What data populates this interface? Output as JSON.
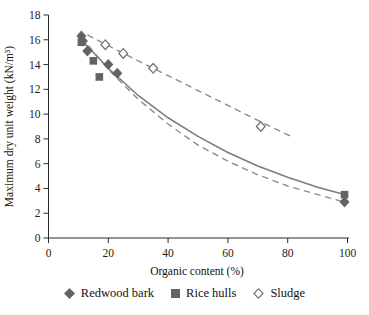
{
  "figure": {
    "background": "#ffffff"
  },
  "colors": {
    "axis": "#2b2b2b",
    "marker_fill": "#636363",
    "open_marker_stroke": "#757575",
    "solid_line": "#7d7d7d",
    "dashed_line": "#8c8c8c",
    "text": "#1c1c1c"
  },
  "chart_data": {
    "type": "scatter",
    "title": "",
    "xlabel": "Organic content (%)",
    "ylabel": "Maximum dry unit weight (kN/m³)",
    "xlim": [
      0,
      100
    ],
    "ylim": [
      0,
      18
    ],
    "xticks": [
      0,
      20,
      40,
      60,
      80,
      100
    ],
    "yticks": [
      0,
      2,
      4,
      6,
      8,
      10,
      12,
      14,
      16,
      18
    ],
    "grid": false,
    "legend_position": "bottom",
    "series": [
      {
        "name": "Redwood bark",
        "marker": "diamond-filled",
        "points": [
          [
            11,
            16.3
          ],
          [
            11.5,
            15.9
          ],
          [
            13,
            15.1
          ],
          [
            20,
            14.0
          ],
          [
            23,
            13.3
          ],
          [
            99,
            2.9
          ]
        ],
        "trendline": {
          "style": "dashed",
          "points": [
            [
              11,
              16.2
            ],
            [
              20,
              13.6
            ],
            [
              30,
              11.2
            ],
            [
              40,
              9.2
            ],
            [
              50,
              7.5
            ],
            [
              60,
              6.2
            ],
            [
              70,
              5.1
            ],
            [
              80,
              4.2
            ],
            [
              90,
              3.5
            ],
            [
              99,
              2.9
            ]
          ]
        }
      },
      {
        "name": "Rice hulls",
        "marker": "square-filled",
        "points": [
          [
            11,
            15.8
          ],
          [
            15,
            14.3
          ],
          [
            17,
            13.0
          ],
          [
            99,
            3.5
          ]
        ],
        "trendline": {
          "style": "solid",
          "points": [
            [
              11,
              16.0
            ],
            [
              20,
              13.7
            ],
            [
              30,
              11.5
            ],
            [
              40,
              9.7
            ],
            [
              50,
              8.2
            ],
            [
              60,
              6.9
            ],
            [
              70,
              5.8
            ],
            [
              80,
              4.9
            ],
            [
              90,
              4.1
            ],
            [
              99,
              3.5
            ]
          ]
        }
      },
      {
        "name": "Sludge",
        "marker": "diamond-open",
        "points": [
          [
            19,
            15.6
          ],
          [
            25,
            14.9
          ],
          [
            35,
            13.7
          ],
          [
            71,
            9.0
          ]
        ],
        "trendline": {
          "style": "dashed",
          "points": [
            [
              13,
              16.4
            ],
            [
              25,
              14.9
            ],
            [
              35,
              13.7
            ],
            [
              45,
              12.5
            ],
            [
              55,
              11.3
            ],
            [
              65,
              10.1
            ],
            [
              75,
              8.9
            ],
            [
              82,
              8.1
            ]
          ]
        }
      }
    ]
  }
}
